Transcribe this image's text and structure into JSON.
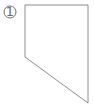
{
  "figure": {
    "label": "figure-panel",
    "width": 94,
    "height": 105,
    "background_color": "#ffffff",
    "stroke_color": "#8c8c8c",
    "stroke_width": 1,
    "marker": {
      "glyph": "①",
      "number": "1",
      "color": "#6e6e6e",
      "center_x": 10,
      "center_y": 12,
      "radius": 6
    },
    "shape": {
      "name": "quadrilateral-outline",
      "fill": "none",
      "vertices": [
        {
          "name": "top-left",
          "x": 25,
          "y": 5
        },
        {
          "name": "top-right",
          "x": 88,
          "y": 5
        },
        {
          "name": "bottom-right",
          "x": 88,
          "y": 103
        },
        {
          "name": "left-lower",
          "x": 25,
          "y": 57
        }
      ],
      "points": "25,5 88,5 88,103 25,57",
      "edges": [
        {
          "name": "top-edge",
          "from": "top-left",
          "to": "top-right"
        },
        {
          "name": "right-edge",
          "from": "top-right",
          "to": "bottom-right"
        },
        {
          "name": "diagonal-edge",
          "from": "bottom-right",
          "to": "left-lower"
        },
        {
          "name": "left-edge",
          "from": "left-lower",
          "to": "top-left"
        }
      ]
    }
  }
}
